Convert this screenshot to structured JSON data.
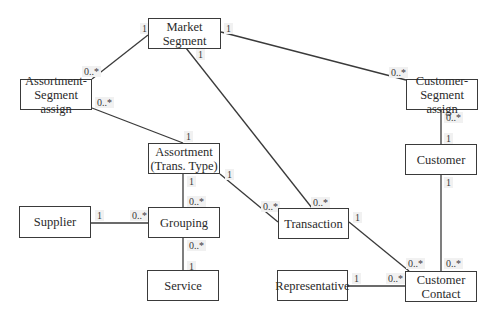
{
  "diagram": {
    "type": "UML class/ER diagram",
    "entities": [
      {
        "id": "market_segment",
        "label": "Market Segment",
        "lines": [
          "Market",
          "Segment"
        ],
        "x": 148,
        "y": 18,
        "w": 73,
        "h": 31
      },
      {
        "id": "assortment_segment_assign",
        "label": "Assortment-Segment assign",
        "lines": [
          "Assortment-",
          "Segment assign"
        ],
        "x": 20,
        "y": 79,
        "w": 72,
        "h": 31
      },
      {
        "id": "customer_segment_assign",
        "label": "Customer-Segment assign",
        "lines": [
          "Customer-",
          "Segment assign"
        ],
        "x": 406,
        "y": 79,
        "w": 72,
        "h": 31
      },
      {
        "id": "assortment",
        "label": "Assortment (Trans. Type)",
        "lines": [
          "Assortment",
          "(Trans. Type)"
        ],
        "x": 148,
        "y": 143,
        "w": 72,
        "h": 31
      },
      {
        "id": "customer",
        "label": "Customer",
        "lines": [
          "Customer"
        ],
        "x": 405,
        "y": 144,
        "w": 72,
        "h": 31
      },
      {
        "id": "supplier",
        "label": "Supplier",
        "lines": [
          "Supplier"
        ],
        "x": 19,
        "y": 206,
        "w": 72,
        "h": 32
      },
      {
        "id": "grouping",
        "label": "Grouping",
        "lines": [
          "Grouping"
        ],
        "x": 148,
        "y": 207,
        "w": 72,
        "h": 31
      },
      {
        "id": "transaction",
        "label": "Transaction",
        "lines": [
          "Transaction"
        ],
        "x": 278,
        "y": 208,
        "w": 71,
        "h": 31
      },
      {
        "id": "service",
        "label": "Service",
        "lines": [
          "Service"
        ],
        "x": 147,
        "y": 270,
        "w": 72,
        "h": 31
      },
      {
        "id": "representative",
        "label": "Representative",
        "lines": [
          "Representative"
        ],
        "x": 277,
        "y": 270,
        "w": 71,
        "h": 31
      },
      {
        "id": "customer_contact",
        "label": "Customer Contact",
        "lines": [
          "Customer",
          "Contact"
        ],
        "x": 405,
        "y": 271,
        "w": 72,
        "h": 31
      }
    ],
    "associations": [
      {
        "from": "market_segment",
        "to": "assortment_segment_assign",
        "from_mult": "1",
        "to_mult": "0..*",
        "x1": 148,
        "y1": 35,
        "x2": 92,
        "y2": 79
      },
      {
        "from": "market_segment",
        "to": "customer_segment_assign",
        "from_mult": "1",
        "to_mult": "0..*",
        "x1": 221,
        "y1": 32,
        "x2": 406,
        "y2": 80
      },
      {
        "from": "market_segment",
        "to": "transaction",
        "from_mult": "1",
        "to_mult": "0..*",
        "x1": 186,
        "y1": 48,
        "x2": 312,
        "y2": 208
      },
      {
        "from": "assortment",
        "to": "assortment_segment_assign",
        "from_mult": "1",
        "to_mult": "0..*",
        "x1": 183,
        "y1": 143,
        "x2": 92,
        "y2": 108
      },
      {
        "from": "assortment",
        "to": "grouping",
        "from_mult": "1",
        "to_mult": "0..*",
        "x1": 183,
        "y1": 174,
        "x2": 183,
        "y2": 207
      },
      {
        "from": "assortment",
        "to": "transaction",
        "from_mult": "1",
        "to_mult": "0..*",
        "x1": 220,
        "y1": 174,
        "x2": 278,
        "y2": 222
      },
      {
        "from": "supplier",
        "to": "grouping",
        "from_mult": "1",
        "to_mult": "0..*",
        "x1": 91,
        "y1": 223,
        "x2": 148,
        "y2": 223
      },
      {
        "from": "service",
        "to": "grouping",
        "from_mult": "1",
        "to_mult": "0..*",
        "x1": 183,
        "y1": 270,
        "x2": 183,
        "y2": 238
      },
      {
        "from": "customer",
        "to": "customer_segment_assign",
        "from_mult": "1",
        "to_mult": "0..*",
        "x1": 441,
        "y1": 144,
        "x2": 441,
        "y2": 110
      },
      {
        "from": "customer",
        "to": "customer_contact",
        "from_mult": "1",
        "to_mult": "0..*",
        "x1": 441,
        "y1": 175,
        "x2": 441,
        "y2": 271
      },
      {
        "from": "transaction",
        "to": "customer_contact",
        "from_mult": "1",
        "to_mult": "0..*",
        "x1": 349,
        "y1": 222,
        "x2": 409,
        "y2": 271
      },
      {
        "from": "representative",
        "to": "customer_contact",
        "from_mult": "1",
        "to_mult": "0..*",
        "x1": 348,
        "y1": 286,
        "x2": 405,
        "y2": 286
      }
    ],
    "multiplicity_labels": [
      {
        "text": "1",
        "x": 140,
        "y": 23
      },
      {
        "text": "1",
        "x": 224,
        "y": 23
      },
      {
        "text": "1",
        "x": 196,
        "y": 49
      },
      {
        "text": "0..*",
        "x": 82,
        "y": 66
      },
      {
        "text": "0..*",
        "x": 95,
        "y": 97
      },
      {
        "text": "0..*",
        "x": 389,
        "y": 67
      },
      {
        "text": "1",
        "x": 184,
        "y": 131
      },
      {
        "text": "0..*",
        "x": 444,
        "y": 112
      },
      {
        "text": "1",
        "x": 444,
        "y": 133
      },
      {
        "text": "1",
        "x": 225,
        "y": 169
      },
      {
        "text": "1",
        "x": 187,
        "y": 176
      },
      {
        "text": "0..*",
        "x": 187,
        "y": 196
      },
      {
        "text": "1",
        "x": 444,
        "y": 177
      },
      {
        "text": "1",
        "x": 95,
        "y": 210
      },
      {
        "text": "0..*",
        "x": 130,
        "y": 210
      },
      {
        "text": "0..*",
        "x": 261,
        "y": 201
      },
      {
        "text": "0..*",
        "x": 311,
        "y": 197
      },
      {
        "text": "1",
        "x": 353,
        "y": 212
      },
      {
        "text": "0..*",
        "x": 187,
        "y": 240
      },
      {
        "text": "1",
        "x": 187,
        "y": 261
      },
      {
        "text": "0..*",
        "x": 406,
        "y": 258
      },
      {
        "text": "0..*",
        "x": 444,
        "y": 258
      },
      {
        "text": "1",
        "x": 352,
        "y": 273
      },
      {
        "text": "0..*",
        "x": 386,
        "y": 273
      }
    ],
    "colors": {
      "line": "#3a3a3a",
      "box_border": "#3a3a3a",
      "box_fill": "#ffffff",
      "text": "#2a2a2a",
      "label_bg": "#f1f1f1"
    }
  }
}
